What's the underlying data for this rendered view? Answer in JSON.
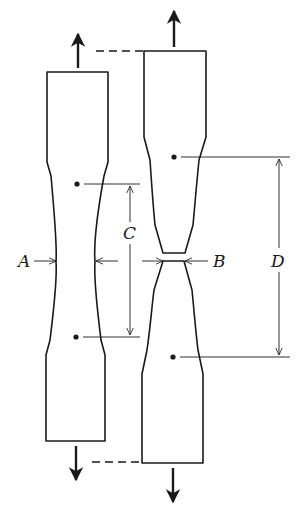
{
  "figure": {
    "labels": {
      "A": "A",
      "B": "B",
      "C": "C",
      "D": "D"
    },
    "colors": {
      "ink": "#1a1a1a",
      "background": "#ffffff"
    },
    "elements": [
      {
        "id": "original-specimen",
        "description": "Original specimen with gage marks, width A, gage length C"
      },
      {
        "id": "fractured-specimen",
        "description": "Necked and fractured specimen, neck width B, final gage length D"
      },
      {
        "id": "force-arrows",
        "description": "Tensile load arrows at both ends of each specimen"
      }
    ]
  }
}
